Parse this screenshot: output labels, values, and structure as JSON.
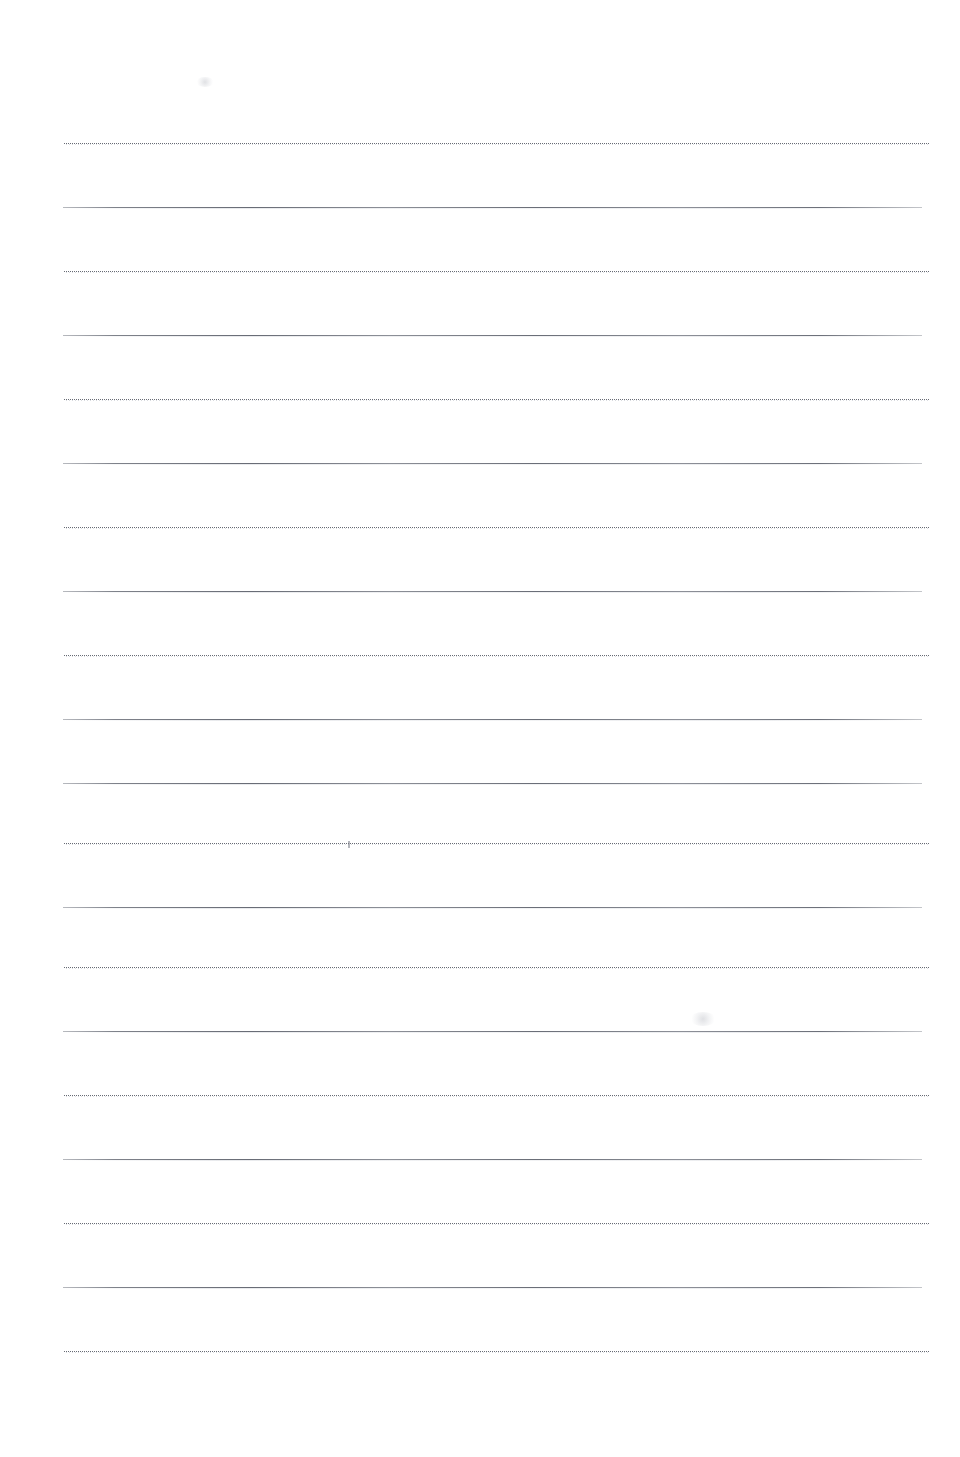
{
  "document": {
    "kind": "scanned-lined-paper",
    "title": "Blank lined writing paper",
    "page_width": 960,
    "page_height": 1457,
    "background_color": "#ffffff",
    "content_text": "",
    "notes_label": ""
  },
  "ruling": {
    "line_count": 20,
    "first_line_y": 143,
    "line_spacing": 64,
    "dotted_style_label": "dotted",
    "solid_style_label": "solid",
    "dotted_color": "#5c606a",
    "solid_color": "#606a72",
    "dotted_left": 63,
    "dotted_right": 930,
    "solid_left": 63,
    "solid_right": 922,
    "lines": [
      {
        "index": 1,
        "y": 143,
        "style": "dotted",
        "left": 64,
        "right": 930
      },
      {
        "index": 2,
        "y": 207,
        "style": "solid",
        "left": 63,
        "right": 922
      },
      {
        "index": 3,
        "y": 271,
        "style": "dotted",
        "left": 64,
        "right": 930
      },
      {
        "index": 4,
        "y": 335,
        "style": "solid",
        "left": 63,
        "right": 922
      },
      {
        "index": 5,
        "y": 399,
        "style": "dotted",
        "left": 64,
        "right": 930
      },
      {
        "index": 6,
        "y": 463,
        "style": "solid",
        "left": 63,
        "right": 922
      },
      {
        "index": 7,
        "y": 527,
        "style": "dotted",
        "left": 64,
        "right": 930
      },
      {
        "index": 8,
        "y": 591,
        "style": "solid",
        "left": 63,
        "right": 922
      },
      {
        "index": 9,
        "y": 655,
        "style": "dotted",
        "left": 64,
        "right": 930
      },
      {
        "index": 10,
        "y": 719,
        "style": "solid",
        "left": 63,
        "right": 922
      },
      {
        "index": 11,
        "y": 783,
        "style": "solid",
        "left": 63,
        "right": 922
      },
      {
        "index": 12,
        "y": 843,
        "style": "dotted",
        "left": 64,
        "right": 930
      },
      {
        "index": 13,
        "y": 907,
        "style": "solid",
        "left": 63,
        "right": 922
      },
      {
        "index": 14,
        "y": 967,
        "style": "dotted",
        "left": 64,
        "right": 930
      },
      {
        "index": 15,
        "y": 1031,
        "style": "solid",
        "left": 63,
        "right": 922
      },
      {
        "index": 16,
        "y": 1095,
        "style": "dotted",
        "left": 64,
        "right": 930
      },
      {
        "index": 17,
        "y": 1159,
        "style": "solid",
        "left": 63,
        "right": 922
      },
      {
        "index": 18,
        "y": 1223,
        "style": "dotted",
        "left": 64,
        "right": 930
      },
      {
        "index": 19,
        "y": 1287,
        "style": "solid",
        "left": 63,
        "right": 922
      },
      {
        "index": 20,
        "y": 1351,
        "style": "dotted",
        "left": 64,
        "right": 930
      }
    ]
  },
  "artifacts": [
    {
      "kind": "speck",
      "x": 348,
      "y": 841,
      "w": 2,
      "h": 7
    },
    {
      "kind": "smudge",
      "x": 690,
      "y": 1012,
      "w": 26,
      "h": 14
    },
    {
      "kind": "smudge",
      "x": 196,
      "y": 77,
      "w": 18,
      "h": 10
    }
  ]
}
